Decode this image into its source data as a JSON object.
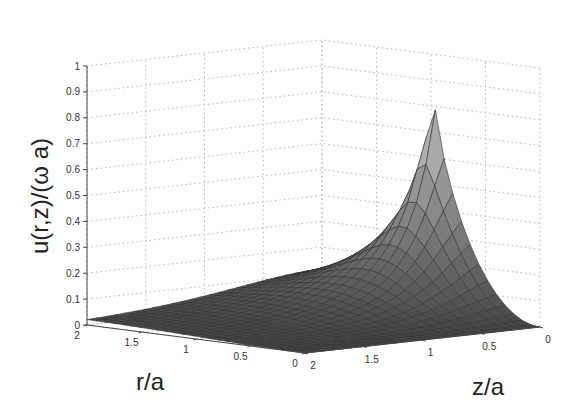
{
  "chart_data": {
    "type": "surface3d",
    "title": "",
    "xlabel": "z/a",
    "ylabel": "r/a",
    "zlabel": "u(r,z)/(ω a)",
    "x_ticks": [
      "0",
      "0.5",
      "1",
      "1.5",
      "2"
    ],
    "y_ticks": [
      "0",
      "0.5",
      "1",
      "1.5",
      "2"
    ],
    "z_ticks": [
      "0",
      "0.1",
      "0.2",
      "0.3",
      "0.4",
      "0.5",
      "0.6",
      "0.7",
      "0.8",
      "0.9",
      "1"
    ],
    "xlim": [
      0,
      2
    ],
    "ylim": [
      0,
      2
    ],
    "zlim": [
      0,
      1
    ],
    "grid": true,
    "colormap": "gray",
    "mesh_resolution": 25,
    "key_points": [
      {
        "r": 1,
        "z": 0,
        "u": 1.0,
        "note": "peak"
      },
      {
        "r": 2,
        "z": 2,
        "u": 0.14
      },
      {
        "r": 0,
        "z": 2,
        "u": 0.0
      },
      {
        "r": 0,
        "z": 0,
        "u": 0.0
      },
      {
        "r": 2,
        "z": 0,
        "u": 0.25
      }
    ]
  },
  "labels": {
    "zlabel": "u(r,z)/(ω a)",
    "rlabel": "r/a",
    "zaxis_label": "z/a"
  }
}
